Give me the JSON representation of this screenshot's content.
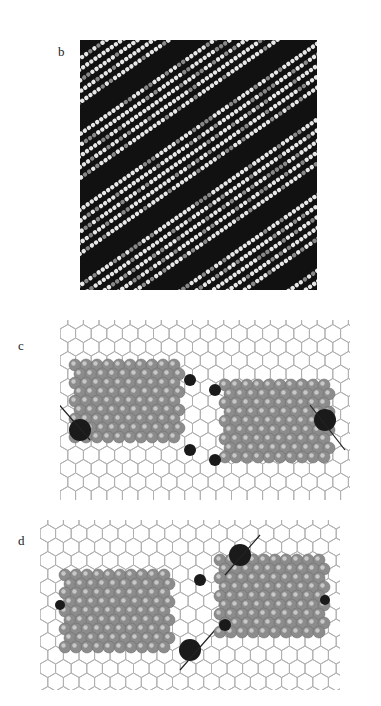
{
  "figure": {
    "panels": [
      {
        "id": "b",
        "label": "b",
        "kind": "STM image of lamellar molecular rows"
      },
      {
        "id": "c",
        "label": "c",
        "kind": "Molecular model on hexagonal lattice"
      },
      {
        "id": "d",
        "label": "d",
        "kind": "Molecular model on hexagonal lattice"
      }
    ]
  },
  "colors": {
    "lattice": "#b0b0b0",
    "atom": "#8c8c8c",
    "atom_highlight": "#c8c8c8",
    "heteroatom": "#1a1a1a",
    "stm_dark": "#111111",
    "stm_bright": "#e8e8e8"
  }
}
